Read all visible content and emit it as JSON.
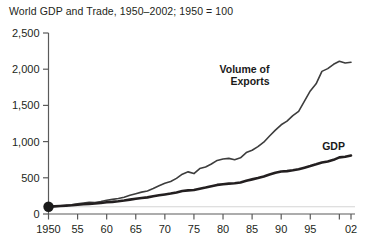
{
  "chart_data": {
    "type": "line",
    "title": "World GDP and Trade, 1950–2002; 1950 = 100",
    "xlabel": "",
    "ylabel": "",
    "xlim": [
      1950,
      2002
    ],
    "ylim": [
      0,
      2500
    ],
    "grid": false,
    "legend_position": "inline-annotations",
    "baseline_value": 100,
    "y_ticks": [
      0,
      500,
      1000,
      1500,
      2000,
      2500
    ],
    "y_tick_labels": [
      "0",
      "500",
      "1,000",
      "1,500",
      "2,000",
      "2,500"
    ],
    "x_ticks": [
      1950,
      1955,
      1960,
      1965,
      1970,
      1975,
      1980,
      1985,
      1990,
      1995,
      2000,
      2002
    ],
    "x_tick_labels": [
      "1950",
      "55",
      "60",
      "65",
      "70",
      "75",
      "80",
      "85",
      "90",
      "95",
      "",
      "02"
    ],
    "marker_points": [
      {
        "x": 1950,
        "y": 100,
        "label": "1950 = 100"
      }
    ],
    "annotations": [
      {
        "text": "Volume of\nExports",
        "lines": [
          "Volume of",
          "Exports"
        ],
        "x": 1988,
        "y": 1950
      },
      {
        "text": "GDP",
        "lines": [
          "GDP"
        ],
        "x": 1999,
        "y": 880
      }
    ],
    "series": [
      {
        "name": "Volume of Exports",
        "color": "#3d3d3d",
        "line_width": 1.6,
        "x": [
          1950,
          1951,
          1952,
          1953,
          1954,
          1955,
          1956,
          1957,
          1958,
          1959,
          1960,
          1961,
          1962,
          1963,
          1964,
          1965,
          1966,
          1967,
          1968,
          1969,
          1970,
          1971,
          1972,
          1973,
          1974,
          1975,
          1976,
          1977,
          1978,
          1979,
          1980,
          1981,
          1982,
          1983,
          1984,
          1985,
          1986,
          1987,
          1988,
          1989,
          1990,
          1991,
          1992,
          1993,
          1994,
          1995,
          1996,
          1997,
          1998,
          1999,
          2000,
          2001,
          2002
        ],
        "values": [
          100,
          108,
          110,
          118,
          128,
          140,
          152,
          160,
          158,
          172,
          190,
          202,
          214,
          232,
          258,
          280,
          302,
          318,
          352,
          390,
          424,
          450,
          492,
          550,
          582,
          558,
          628,
          650,
          690,
          740,
          760,
          768,
          750,
          776,
          848,
          880,
          930,
          992,
          1078,
          1158,
          1232,
          1282,
          1358,
          1418,
          1560,
          1700,
          1798,
          1970,
          2008,
          2068,
          2110,
          2085,
          2095
        ]
      },
      {
        "name": "GDP",
        "color": "#231f20",
        "line_width": 2.6,
        "x": [
          1950,
          1951,
          1952,
          1953,
          1954,
          1955,
          1956,
          1957,
          1958,
          1959,
          1960,
          1961,
          1962,
          1963,
          1964,
          1965,
          1966,
          1967,
          1968,
          1969,
          1970,
          1971,
          1972,
          1973,
          1974,
          1975,
          1976,
          1977,
          1978,
          1979,
          1980,
          1981,
          1982,
          1983,
          1984,
          1985,
          1986,
          1987,
          1988,
          1989,
          1990,
          1991,
          1992,
          1993,
          1994,
          1995,
          1996,
          1997,
          1998,
          1999,
          2000,
          2001,
          2002
        ],
        "values": [
          100,
          105,
          110,
          116,
          120,
          128,
          134,
          140,
          144,
          152,
          162,
          168,
          176,
          186,
          198,
          210,
          222,
          230,
          244,
          258,
          270,
          282,
          298,
          318,
          326,
          332,
          350,
          366,
          384,
          402,
          412,
          420,
          424,
          436,
          460,
          478,
          496,
          518,
          546,
          570,
          586,
          592,
          604,
          618,
          640,
          662,
          686,
          712,
          726,
          748,
          782,
          790,
          808
        ]
      }
    ],
    "series_scale_note": "values are index numbers, 1950 = 100"
  },
  "axis": {
    "axis_color": "#5a5a5a",
    "baseline_grid_color": "#d4d4d4"
  }
}
